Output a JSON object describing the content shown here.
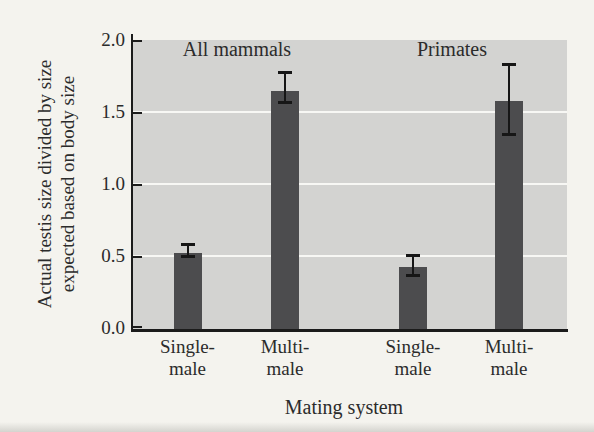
{
  "chart_data": {
    "type": "bar",
    "title": "",
    "xlabel": "Mating system",
    "ylabel": "Actual testis size divided by size expected based on body size",
    "ylabel_lines": [
      "Actual testis size divided by size",
      "expected based on body size"
    ],
    "ylim": [
      0,
      2.0
    ],
    "yticks": [
      "0.0",
      "0.5",
      "1.0",
      "1.5",
      "2.0"
    ],
    "grid": "horizontal-white-at-0.5-intervals",
    "legend": "none",
    "group_titles": [
      {
        "label": "All mammals"
      },
      {
        "label": "Primates"
      }
    ],
    "categories": [
      "Single-male",
      "Multi-male",
      "Single-male",
      "Multi-male"
    ],
    "values": [
      0.53,
      1.65,
      0.43,
      1.58
    ],
    "bars": [
      {
        "group": "All mammals",
        "category_lines": [
          "Single-",
          "male"
        ],
        "value": 0.53,
        "err_low": 0.04,
        "err_high": 0.05
      },
      {
        "group": "All mammals",
        "category_lines": [
          "Multi-",
          "male"
        ],
        "value": 1.65,
        "err_low": 0.09,
        "err_high": 0.13
      },
      {
        "group": "Primates",
        "category_lines": [
          "Single-",
          "male"
        ],
        "value": 0.43,
        "err_low": 0.07,
        "err_high": 0.08
      },
      {
        "group": "Primates",
        "category_lines": [
          "Multi-",
          "male"
        ],
        "value": 1.58,
        "err_low": 0.24,
        "err_high": 0.25
      }
    ],
    "colors": {
      "bar": "#4c4c4e",
      "plot_background": "#d3d3d1",
      "gridline": "#f7f7f4",
      "axis": "#1b1b1b",
      "error_bar": "#161616",
      "text": "#2b2b2b",
      "page_background": "#f4f3ee"
    }
  }
}
